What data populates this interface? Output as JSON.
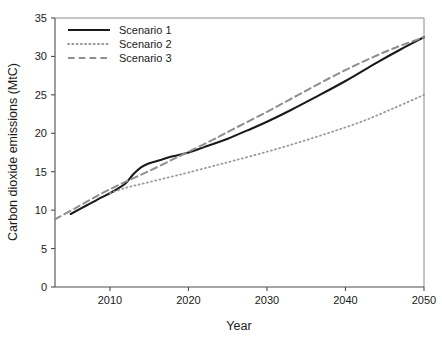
{
  "chart_data": {
    "type": "line",
    "title": "",
    "xlabel": "Year",
    "ylabel": "Carbon dioxide emissions (MtC)",
    "xlim": [
      2003,
      2050
    ],
    "ylim": [
      0,
      35
    ],
    "xticks": [
      2010,
      2020,
      2030,
      2040,
      2050
    ],
    "xtick_labels": [
      "2010",
      "2020",
      "2030",
      "2040",
      "2050"
    ],
    "yticks": [
      0,
      5,
      10,
      15,
      20,
      25,
      30,
      35
    ],
    "ytick_labels": [
      "0",
      "5",
      "10",
      "15",
      "20",
      "25",
      "30",
      "35"
    ],
    "grid": false,
    "legend_position": "upper left",
    "series": [
      {
        "name": "Scenario 1",
        "style": "solid",
        "color": "#1a1a1a",
        "width": 2.1,
        "x": [
          2005,
          2007,
          2009,
          2010,
          2011,
          2012,
          2013,
          2014,
          2015,
          2016,
          2018,
          2020,
          2022,
          2025,
          2028,
          2030,
          2033,
          2036,
          2040,
          2044,
          2047,
          2050
        ],
        "y": [
          9.5,
          10.6,
          11.7,
          12.2,
          12.8,
          13.5,
          14.7,
          15.6,
          16.1,
          16.4,
          17.0,
          17.5,
          18.2,
          19.3,
          20.6,
          21.5,
          23.0,
          24.6,
          26.8,
          29.2,
          30.9,
          32.5
        ]
      },
      {
        "name": "Scenario 2",
        "style": "dotted",
        "color": "#9a9a9a",
        "width": 1.8,
        "x": [
          2010,
          2012,
          2014,
          2016,
          2018,
          2020,
          2023,
          2026,
          2030,
          2034,
          2038,
          2042,
          2046,
          2050
        ],
        "y": [
          12.2,
          12.9,
          13.4,
          13.9,
          14.4,
          14.9,
          15.7,
          16.5,
          17.6,
          18.8,
          20.1,
          21.5,
          23.2,
          25.0
        ]
      },
      {
        "name": "Scenario 3",
        "style": "dashed",
        "color": "#8e8e8e",
        "width": 2.0,
        "x": [
          2003,
          2006,
          2009,
          2012,
          2015,
          2018,
          2020,
          2023,
          2026,
          2030,
          2034,
          2038,
          2042,
          2046,
          2050
        ],
        "y": [
          8.8,
          10.5,
          12.2,
          13.7,
          15.1,
          16.6,
          17.6,
          19.1,
          20.7,
          22.8,
          25.0,
          27.2,
          29.2,
          31.0,
          32.5
        ]
      }
    ]
  },
  "legend": {
    "entries": [
      {
        "label": "Scenario 1"
      },
      {
        "label": "Scenario 2"
      },
      {
        "label": "Scenario 3"
      }
    ]
  }
}
